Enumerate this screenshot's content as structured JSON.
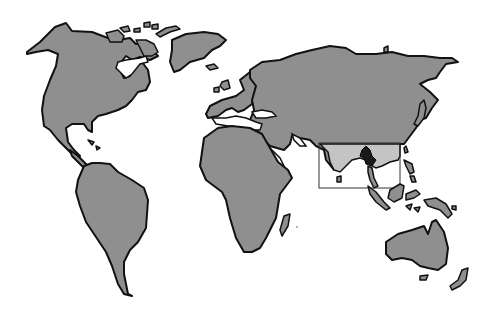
{
  "map": {
    "type": "world-outline-illustration",
    "colors": {
      "background": "#ffffff",
      "land": "#8f8f8f",
      "outline": "#111111",
      "highlight_region": "#c4c4c4",
      "focus_country": "#1a1a1a",
      "inset_box": "#333333"
    },
    "continents": [
      "North America",
      "South America",
      "Europe",
      "Africa",
      "Asia",
      "Australia"
    ],
    "highlight": {
      "region": "Southeast Asia / South Asia",
      "box": {
        "x": 319,
        "y": 143,
        "width": 81,
        "height": 45
      },
      "focus_area": "Myanmar / Thailand (dark)"
    }
  }
}
